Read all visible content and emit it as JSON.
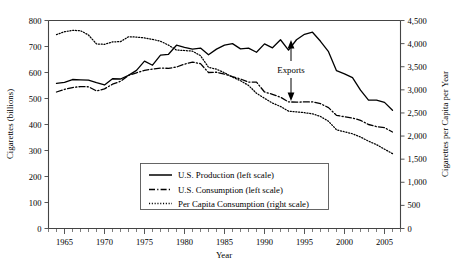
{
  "chart_data": {
    "type": "line",
    "title": "",
    "xlabel": "Year",
    "ylabel": "Cigarettes (billions)",
    "y2label": "Cigarettes per Capita per Year",
    "xlim": [
      1963,
      2007
    ],
    "ylim": [
      0,
      800
    ],
    "y2lim": [
      0,
      4500
    ],
    "grid": false,
    "legend_position": "inside-bottom-center",
    "xticks_major": [
      1965,
      1970,
      1975,
      1980,
      1985,
      1990,
      1995,
      2000,
      2005
    ],
    "xticks_major_labels": [
      "1965",
      "1970",
      "1975",
      "1980",
      "1985",
      "1990",
      "1995",
      "2000",
      "2005"
    ],
    "xticks_minor_step": 1,
    "yticks": [
      0,
      100,
      200,
      300,
      400,
      500,
      600,
      700,
      800
    ],
    "ytick_labels": [
      "0",
      "100",
      "200",
      "300",
      "400",
      "500",
      "600",
      "700",
      "800"
    ],
    "y2ticks": [
      0,
      500,
      1000,
      1500,
      2000,
      2500,
      3000,
      3500,
      4000,
      4500
    ],
    "y2tick_labels": [
      "0",
      "500",
      "1,000",
      "1,500",
      "2,000",
      "2,500",
      "3,000",
      "3,500",
      "4,000",
      "4,500"
    ],
    "x": [
      1964,
      1965,
      1966,
      1967,
      1968,
      1969,
      1970,
      1971,
      1972,
      1973,
      1974,
      1975,
      1976,
      1977,
      1978,
      1979,
      1980,
      1981,
      1982,
      1983,
      1984,
      1985,
      1986,
      1987,
      1988,
      1989,
      1990,
      1991,
      1992,
      1993,
      1994,
      1995,
      1996,
      1997,
      1998,
      1999,
      2000,
      2001,
      2002,
      2003,
      2004,
      2005,
      2006
    ],
    "series": [
      {
        "name": "U.S. Production (left scale)",
        "axis": "left",
        "style": "solid",
        "values": [
          558,
          562,
          573,
          572,
          571,
          561,
          552,
          576,
          575,
          589,
          608,
          644,
          628,
          667,
          670,
          705,
          697,
          690,
          694,
          668,
          690,
          705,
          711,
          691,
          694,
          678,
          710,
          695,
          726,
          686,
          726,
          747,
          755,
          720,
          680,
          607,
          595,
          580,
          532,
          494,
          494,
          485,
          455
        ]
      },
      {
        "name": "U.S. Consumption (left scale)",
        "axis": "left",
        "style": "dash-dot",
        "values": [
          525,
          535,
          542,
          546,
          545,
          529,
          537,
          555,
          566,
          589,
          599,
          608,
          613,
          617,
          616,
          621,
          632,
          640,
          634,
          600,
          601,
          594,
          584,
          575,
          563,
          563,
          525,
          516,
          505,
          487,
          486,
          487,
          487,
          480,
          465,
          435,
          430,
          425,
          416,
          400,
          392,
          388,
          371
        ]
      },
      {
        "name": "Per Capita Consumption (right scale)",
        "axis": "right",
        "style": "dotted",
        "values": [
          4194,
          4258,
          4287,
          4280,
          4186,
          3993,
          3985,
          4037,
          4043,
          4148,
          4141,
          4123,
          4092,
          4051,
          3967,
          3861,
          3851,
          3836,
          3739,
          3488,
          3446,
          3370,
          3274,
          3197,
          3096,
          2926,
          2817,
          2713,
          2640,
          2539,
          2524,
          2505,
          2482,
          2423,
          2320,
          2136,
          2092,
          2049,
          1979,
          1890,
          1814,
          1716,
          1619
        ]
      }
    ],
    "annotations": [
      {
        "name": "exports-gap",
        "label": "Exports",
        "x": 1994,
        "kind": "double-arrow-vertical",
        "note": "vertical double-headed arrow spanning the gap between the U.S. Production and U.S. Consumption lines"
      }
    ]
  }
}
